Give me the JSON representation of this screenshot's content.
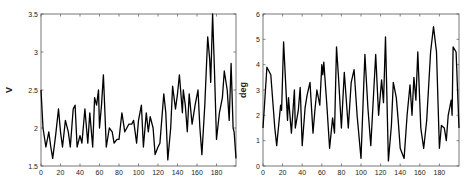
{
  "chart_data": [
    {
      "type": "line",
      "title": "",
      "xlabel": "",
      "ylabel": "V",
      "xlim": [
        0,
        200
      ],
      "ylim": [
        1.5,
        3.5
      ],
      "xticks": [
        0,
        20,
        40,
        60,
        80,
        100,
        120,
        140,
        160,
        180
      ],
      "yticks": [
        1.5,
        2,
        2.5,
        3,
        3.5
      ],
      "ytick_labels": [
        "1.5",
        "2",
        "2.5",
        "3",
        "3.5"
      ],
      "grid": false,
      "legend": null,
      "series": [
        {
          "name": "V",
          "color": "#000000",
          "x": [
            0,
            2,
            5,
            8,
            10,
            12,
            15,
            18,
            20,
            22,
            25,
            28,
            30,
            33,
            35,
            37,
            40,
            42,
            45,
            48,
            50,
            53,
            55,
            57,
            59,
            60,
            62,
            64,
            67,
            70,
            73,
            75,
            78,
            80,
            83,
            86,
            88,
            90,
            93,
            95,
            98,
            100,
            103,
            105,
            108,
            110,
            112,
            115,
            117,
            120,
            122,
            125,
            126,
            128,
            130,
            133,
            135,
            138,
            140,
            142,
            145,
            146,
            148,
            150,
            152,
            155,
            158,
            161,
            163,
            165,
            168,
            171,
            173,
            174,
            176,
            178,
            180,
            183,
            186,
            188,
            191,
            193,
            195,
            197,
            198,
            200
          ],
          "y": [
            2.5,
            2.0,
            1.75,
            1.95,
            1.75,
            1.6,
            1.9,
            2.25,
            1.95,
            1.75,
            2.1,
            1.95,
            1.75,
            2.25,
            2.3,
            1.75,
            1.9,
            1.8,
            2.25,
            1.8,
            2.2,
            1.75,
            2.4,
            2.3,
            2.5,
            2.0,
            2.3,
            2.7,
            1.75,
            2.0,
            1.95,
            1.8,
            1.85,
            1.85,
            2.2,
            1.95,
            2.0,
            2.05,
            2.05,
            2.1,
            1.8,
            2.1,
            2.3,
            1.75,
            2.2,
            1.95,
            2.15,
            2.0,
            1.65,
            1.75,
            1.8,
            2.3,
            2.45,
            2.2,
            1.58,
            2.0,
            2.55,
            2.25,
            2.45,
            2.7,
            2.2,
            2.5,
            2.3,
            1.95,
            2.45,
            2.05,
            2.3,
            2.5,
            2.0,
            1.65,
            2.3,
            3.2,
            2.9,
            2.6,
            3.5,
            2.7,
            1.85,
            2.2,
            2.4,
            2.75,
            2.5,
            2.1,
            2.85,
            2.0,
            1.95,
            1.6
          ]
        }
      ]
    },
    {
      "type": "line",
      "title": "",
      "xlabel": "",
      "ylabel": "deg",
      "xlim": [
        0,
        200
      ],
      "ylim": [
        0,
        6
      ],
      "xticks": [
        0,
        20,
        40,
        60,
        80,
        100,
        120,
        140,
        160,
        180
      ],
      "yticks": [
        0,
        1,
        2,
        3,
        4,
        5,
        6
      ],
      "ytick_labels": [
        "0",
        "1",
        "2",
        "3",
        "4",
        "5",
        "6"
      ],
      "grid": false,
      "legend": null,
      "series": [
        {
          "name": "deg",
          "color": "#000000",
          "x": [
            0,
            4,
            8,
            12,
            14,
            18,
            19,
            21,
            25,
            26,
            29,
            32,
            33,
            36,
            38,
            40,
            43,
            45,
            48,
            51,
            53,
            55,
            58,
            60,
            61,
            62,
            65,
            68,
            71,
            73,
            75,
            77,
            80,
            83,
            87,
            90,
            93,
            96,
            100,
            104,
            107,
            110,
            115,
            118,
            121,
            123,
            125,
            128,
            131,
            133,
            136,
            138,
            140,
            144,
            147,
            150,
            152,
            154,
            156,
            158,
            161,
            164,
            167,
            171,
            174,
            177,
            180,
            182,
            185,
            187,
            189,
            192,
            193,
            194,
            197,
            200
          ],
          "y": [
            1.5,
            3.9,
            3.6,
            1.5,
            0.8,
            2.4,
            2.2,
            4.9,
            1.8,
            2.7,
            1.3,
            3.0,
            1.5,
            2.2,
            3.1,
            0.8,
            2.3,
            2.8,
            3.3,
            1.3,
            2.2,
            3.0,
            2.4,
            4.0,
            3.6,
            4.1,
            2.5,
            0.7,
            1.9,
            1.3,
            4.7,
            3.5,
            1.5,
            3.7,
            1.5,
            3.3,
            3.8,
            2.0,
            0.3,
            4.4,
            2.3,
            0.8,
            4.4,
            2.0,
            3.4,
            2.5,
            5.1,
            0.2,
            1.6,
            3.3,
            2.7,
            1.8,
            0.7,
            0.3,
            2.0,
            3.2,
            2.0,
            3.5,
            2.6,
            4.5,
            1.5,
            0.7,
            1.8,
            4.5,
            5.5,
            4.5,
            0.7,
            1.6,
            1.5,
            1.0,
            2.0,
            2.6,
            2.0,
            4.7,
            4.5,
            1.5
          ]
        }
      ]
    }
  ]
}
